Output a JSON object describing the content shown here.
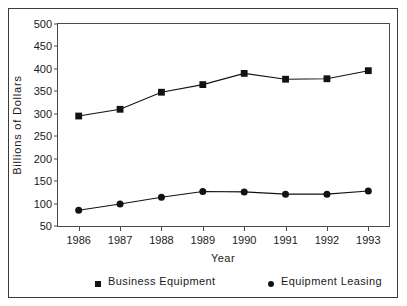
{
  "figure": {
    "clipped_header_text": "",
    "background": "#ffffff",
    "frame_color": "#3a3a3a"
  },
  "axes": {
    "y_label": "Billions  of  Dollars",
    "x_label": "Year",
    "y_ticks": [
      500,
      450,
      400,
      350,
      300,
      250,
      200,
      150,
      100,
      50
    ],
    "y_min": 50,
    "y_max": 500,
    "x_ticks": [
      "1986",
      "1987",
      "1988",
      "1989",
      "1990",
      "1991",
      "1992",
      "1993"
    ]
  },
  "legend": {
    "items": [
      {
        "label": "Business  Equipment",
        "marker": "square",
        "color": "#121212"
      },
      {
        "label": "Equipment  Leasing",
        "marker": "circle",
        "color": "#121212"
      }
    ]
  },
  "chart_data": {
    "type": "line",
    "title": "",
    "xlabel": "Year",
    "ylabel": "Billions of Dollars",
    "categories": [
      "1986",
      "1987",
      "1988",
      "1989",
      "1990",
      "1991",
      "1992",
      "1993"
    ],
    "ylim": [
      50,
      500
    ],
    "ytick_step": 50,
    "grid": false,
    "legend_position": "bottom",
    "series": [
      {
        "name": "Business  Equipment",
        "marker": "square",
        "color": "#121212",
        "values": [
          295,
          310,
          348,
          365,
          390,
          377,
          378,
          396
        ]
      },
      {
        "name": "Equipment  Leasing",
        "marker": "circle",
        "color": "#121212",
        "values": [
          85,
          99,
          114,
          127,
          126,
          121,
          121,
          128
        ]
      }
    ]
  }
}
